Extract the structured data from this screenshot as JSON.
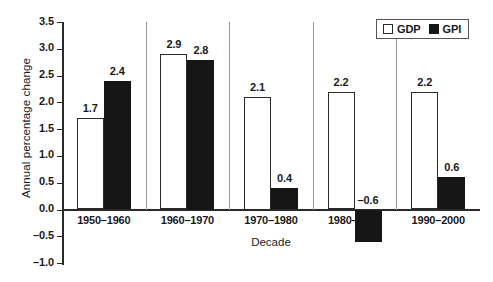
{
  "chart_data": {
    "type": "bar",
    "title": "",
    "xlabel": "Decade",
    "ylabel": "Annual percentage change",
    "categories": [
      "1950–1960",
      "1960–1970",
      "1970–1980",
      "1980–1990",
      "1990–2000"
    ],
    "series": [
      {
        "name": "GDP",
        "color": "#ffffff",
        "values": [
          1.7,
          2.9,
          2.1,
          2.2,
          2.2
        ],
        "labels": [
          "1.7",
          "2.9",
          "2.1",
          "2.2",
          "2.2"
        ]
      },
      {
        "name": "GPI",
        "color": "#161616",
        "values": [
          2.4,
          2.8,
          0.4,
          -0.6,
          0.6
        ],
        "labels": [
          "2.4",
          "2.8",
          "0.4",
          "–0.6",
          "0.6"
        ]
      }
    ],
    "ylim": [
      -1.0,
      3.5
    ],
    "ytick_values": [
      3.5,
      3.0,
      2.5,
      2.0,
      1.5,
      1.0,
      0.5,
      0.0,
      -0.5,
      -1.0
    ],
    "ytick_labels": [
      "3.5",
      "3.0",
      "2.5",
      "2.0",
      "1.5",
      "1.0",
      "0.5",
      "0.0",
      "–0.5",
      "–1.0"
    ],
    "grid": false,
    "legend_position": "top-right",
    "legend_entries": [
      "GDP",
      "GPI"
    ]
  }
}
